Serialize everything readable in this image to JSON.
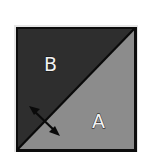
{
  "diagram": {
    "regions": [
      {
        "id": "B",
        "label": "B",
        "position": "upper-left triangle",
        "color": "#2e2e2e"
      },
      {
        "id": "A",
        "label": "A",
        "position": "lower-right triangle",
        "color": "#8c8c8c"
      }
    ],
    "divider": {
      "type": "diagonal line",
      "from": "bottom-left",
      "to": "top-right",
      "color": "#0a0a0a"
    },
    "arrow": {
      "type": "double-headed arrow",
      "crosses": "diagonal",
      "icon": "double-arrow-icon",
      "color": "#0a0a0a"
    },
    "border_color": "#0d0d0d",
    "highlight_color": "#e6e6e6"
  }
}
